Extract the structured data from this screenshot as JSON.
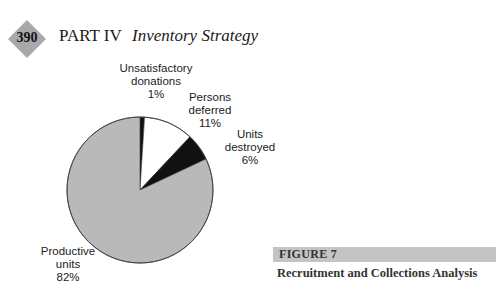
{
  "header": {
    "page_number": "390",
    "part": "PART IV",
    "section": "Inventory Strategy"
  },
  "figure": {
    "label": "FIGURE 7",
    "caption": "Recruitment and Collections Analysis"
  },
  "labels": {
    "unsatisfactory": {
      "line1": "Unsatisfactory",
      "line2": "donations",
      "pct": "1%"
    },
    "deferred": {
      "line1": "Persons",
      "line2": "deferred",
      "pct": "11%"
    },
    "destroyed": {
      "line1": "Units",
      "line2": "destroyed",
      "pct": "6%"
    },
    "productive": {
      "line1": "Productive",
      "line2": "units",
      "pct": "82%"
    }
  },
  "colors": {
    "productive": "#b9b9b9",
    "deferred": "#ffffff",
    "destroyed": "#111111",
    "unsatisfactory": "#111111",
    "badge": "#a9a9a9",
    "figure_bar": "#c4c4c4"
  },
  "chart_data": {
    "type": "pie",
    "title": "Recruitment and Collections Analysis",
    "categories": [
      "Unsatisfactory donations",
      "Persons deferred",
      "Units destroyed",
      "Productive units"
    ],
    "values": [
      1,
      11,
      6,
      82
    ],
    "unit": "%",
    "start_angle": "12 o'clock, clockwise",
    "legend": "none (direct labels)"
  }
}
